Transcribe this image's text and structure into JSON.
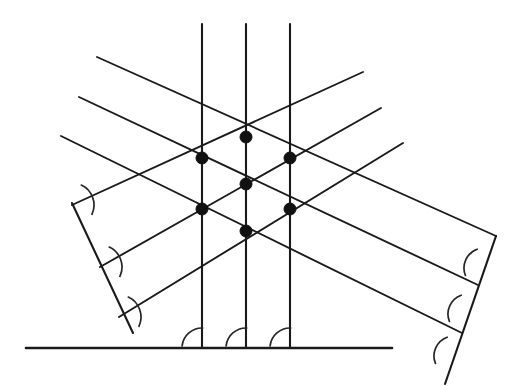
{
  "figure": {
    "kind": "geometry-diagram",
    "canvas": {
      "width": 522,
      "height": 386,
      "background": "#ffffff"
    },
    "colors": {
      "line": "#1a1a1a",
      "arc": "#262626",
      "dot": "#111111",
      "background": "#ffffff"
    },
    "baseline": {
      "label": "base-horizontal-line",
      "x1": 26,
      "y1": 348,
      "x2": 392,
      "y2": 348
    },
    "vertical_lines": [
      {
        "label": "vertical-line-left",
        "x1": 202,
        "y1": 24,
        "x2": 202,
        "y2": 348
      },
      {
        "label": "vertical-line-center",
        "x1": 246,
        "y1": 24,
        "x2": 246,
        "y2": 348
      },
      {
        "label": "vertical-line-right",
        "x1": 290,
        "y1": 24,
        "x2": 290,
        "y2": 348
      }
    ],
    "descending_lines": [
      {
        "label": "descending-line-1",
        "x1": 97,
        "y1": 57,
        "x2": 496,
        "y2": 236
      },
      {
        "label": "descending-line-2",
        "x1": 79,
        "y1": 97,
        "x2": 478,
        "y2": 285
      },
      {
        "label": "descending-line-3",
        "x1": 61,
        "y1": 136,
        "x2": 462,
        "y2": 333
      }
    ],
    "ascending_lines": [
      {
        "label": "ascending-line-1",
        "x1": 72,
        "y1": 205,
        "x2": 363,
        "y2": 72
      },
      {
        "label": "ascending-line-2",
        "x1": 100,
        "y1": 267,
        "x2": 381,
        "y2": 108
      },
      {
        "label": "ascending-line-3",
        "x1": 119,
        "y1": 317,
        "x2": 403,
        "y2": 143
      }
    ],
    "transversals": [
      {
        "label": "left-transversal",
        "x1": 72,
        "y1": 203,
        "x2": 133,
        "y2": 333
      },
      {
        "label": "right-transversal",
        "x1": 496,
        "y1": 236,
        "x2": 445,
        "y2": 384
      }
    ],
    "intersection_dots": [
      {
        "label": "node-top-center",
        "cx": 246,
        "cy": 137,
        "r": 6.0
      },
      {
        "label": "node-upper-left",
        "cx": 202,
        "cy": 158,
        "r": 6.0
      },
      {
        "label": "node-upper-right",
        "cx": 290,
        "cy": 158,
        "r": 6.0
      },
      {
        "label": "node-middle-center",
        "cx": 246,
        "cy": 184,
        "r": 6.0
      },
      {
        "label": "node-lower-left",
        "cx": 202,
        "cy": 209,
        "r": 6.0
      },
      {
        "label": "node-lower-right",
        "cx": 290,
        "cy": 209,
        "r": 6.0
      },
      {
        "label": "node-bottom-center",
        "cx": 246,
        "cy": 231,
        "r": 6.0
      }
    ],
    "angle_marks": {
      "base": [
        {
          "label": "base-angle-left",
          "vx": 202,
          "vy": 348,
          "r": 20,
          "a1": 186,
          "a2": 272
        },
        {
          "label": "base-angle-center",
          "vx": 246,
          "vy": 348,
          "r": 20,
          "a1": 186,
          "a2": 272
        },
        {
          "label": "base-angle-right",
          "vx": 290,
          "vy": 348,
          "r": 20,
          "a1": 186,
          "a2": 272
        }
      ],
      "left_transversal": [
        {
          "label": "left-angle-1",
          "vx": 72,
          "vy": 205,
          "r": 22,
          "a1": 295,
          "a2": 25
        },
        {
          "label": "left-angle-2",
          "vx": 100,
          "vy": 267,
          "r": 22,
          "a1": 295,
          "a2": 25
        },
        {
          "label": "left-angle-3",
          "vx": 119,
          "vy": 317,
          "r": 22,
          "a1": 295,
          "a2": 25
        }
      ],
      "right_transversal": [
        {
          "label": "right-angle-1",
          "vx": 484,
          "vy": 268,
          "r": 20,
          "a1": 158,
          "a2": 250
        },
        {
          "label": "right-angle-2",
          "vx": 468,
          "vy": 314,
          "r": 20,
          "a1": 158,
          "a2": 250
        },
        {
          "label": "right-angle-3",
          "vx": 454,
          "vy": 356,
          "r": 20,
          "a1": 158,
          "a2": 250
        }
      ]
    },
    "counts": {
      "vertical_lines": 3,
      "descending_lines": 3,
      "ascending_lines": 3,
      "transversals": 2,
      "intersection_dots": 7,
      "angle_marks": 9
    }
  }
}
